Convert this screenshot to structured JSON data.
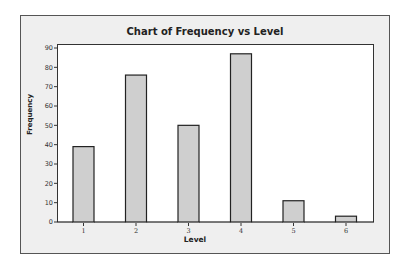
{
  "chart_data": {
    "type": "bar",
    "title": "Chart of Frequency vs Level",
    "xlabel": "Level",
    "ylabel": "Frequency",
    "categories": [
      "1",
      "2",
      "3",
      "4",
      "5",
      "6"
    ],
    "values": [
      39,
      76,
      50,
      87,
      11,
      3
    ],
    "ylim": [
      0,
      90
    ],
    "yticks": [
      0,
      10,
      20,
      30,
      40,
      50,
      60,
      70,
      80,
      90
    ],
    "grid": false,
    "legend": null,
    "bar_color": "#cfcfcf",
    "bar_edge_color": "#222222"
  }
}
